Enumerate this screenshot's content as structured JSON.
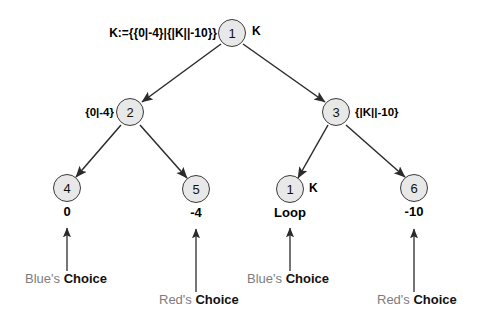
{
  "diagram": {
    "title_formula": "K:={{0|-4}|{|K||-10}}",
    "nodes": [
      {
        "id": "root",
        "label": "1",
        "side_label": "K"
      },
      {
        "id": "n2",
        "label": "2",
        "side_label": "{0|-4}"
      },
      {
        "id": "n3",
        "label": "3",
        "side_label": "{|K||-10}"
      },
      {
        "id": "n4",
        "label": "4",
        "value": "0"
      },
      {
        "id": "n5",
        "label": "5",
        "value": "-4"
      },
      {
        "id": "n1loop",
        "label": "1",
        "side_label": "K",
        "value": "Loop"
      },
      {
        "id": "n6",
        "label": "6",
        "value": "-10"
      }
    ],
    "annotations": [
      {
        "id": "blue-left",
        "who": "Blue's",
        "word": "Choice"
      },
      {
        "id": "red-left",
        "who": "Red's",
        "word": "Choice"
      },
      {
        "id": "blue-right",
        "who": "Blue's",
        "word": "Choice"
      },
      {
        "id": "red-right",
        "who": "Red's",
        "word": "Choice"
      }
    ],
    "colors": {
      "node_fill": "#e8e8e8",
      "node_stroke": "#3a3a3a",
      "text": "#111111",
      "muted_text": "#7d7d7d",
      "edge": "#2b2b2b"
    }
  }
}
